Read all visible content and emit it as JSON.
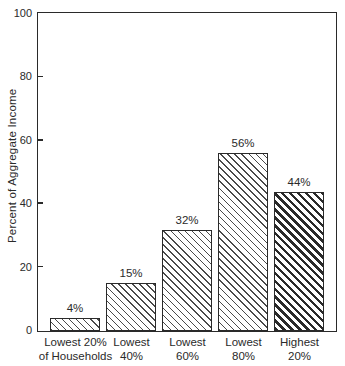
{
  "figure": {
    "background": "#ffffff",
    "ink_color": "#2a2a2a"
  },
  "chart_data": {
    "type": "bar",
    "title": "",
    "ylabel": "Percent of Aggregate Income",
    "xlabel": "",
    "ylim": [
      0,
      100
    ],
    "yticks": [
      0,
      20,
      40,
      60,
      80,
      100
    ],
    "ytick_labels": [
      "0",
      "20",
      "40",
      "60",
      "80",
      "100"
    ],
    "tick_style": "inward dashes on left axis at 20/40/60/80",
    "grid": false,
    "legend": "none",
    "frame": "full box border around plot area",
    "categories": [
      "Lowest 20% of Households",
      "Lowest 40%",
      "Lowest 60%",
      "Lowest 80%",
      "Highest 20%"
    ],
    "category_label_lines": [
      [
        "Lowest 20%",
        "of Households"
      ],
      [
        "Lowest",
        "40%"
      ],
      [
        "Lowest",
        "60%"
      ],
      [
        "Lowest",
        "80%"
      ],
      [
        "Highest",
        "20%"
      ]
    ],
    "values": [
      4,
      15,
      32,
      56,
      44
    ],
    "bar_value_labels": [
      "4%",
      "15%",
      "32%",
      "56%",
      "44%"
    ],
    "bar_hatch": [
      "thin-backslash-diagonal",
      "thin-backslash-diagonal",
      "thin-backslash-diagonal",
      "thin-backslash-diagonal",
      "thick-backslash-diagonal"
    ]
  }
}
